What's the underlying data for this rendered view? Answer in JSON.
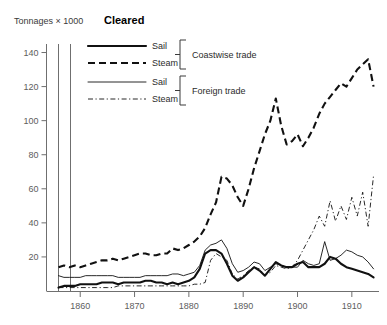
{
  "chart_data": {
    "type": "line",
    "title": "Cleared",
    "ylabel": "Tonnages × 1000",
    "xlabel": "",
    "xlim": [
      1856,
      1915
    ],
    "ylim": [
      0,
      145
    ],
    "grid": false,
    "legend_position": "top-center",
    "y_ticks": [
      20,
      40,
      60,
      80,
      100,
      120,
      140
    ],
    "x_ticks": [
      1860,
      1870,
      1880,
      1890,
      1900,
      1910
    ],
    "legend_groups": [
      {
        "group_label": "Coastwise trade",
        "entries": [
          {
            "name": "Sail",
            "style": "thick-solid"
          },
          {
            "name": "Steam",
            "style": "thick-dashed"
          }
        ]
      },
      {
        "group_label": "Foreign trade",
        "entries": [
          {
            "name": "Sail",
            "style": "thin-solid"
          },
          {
            "name": "Steam",
            "style": "thin-dash-dot"
          }
        ]
      }
    ],
    "series": [
      {
        "name": "Coastwise Sail",
        "style": "thick-solid",
        "x": [
          1856,
          1857,
          1858,
          1859,
          1860,
          1861,
          1862,
          1863,
          1864,
          1865,
          1866,
          1867,
          1868,
          1869,
          1870,
          1871,
          1872,
          1873,
          1874,
          1875,
          1876,
          1877,
          1878,
          1879,
          1880,
          1881,
          1882,
          1883,
          1884,
          1885,
          1886,
          1887,
          1888,
          1889,
          1890,
          1891,
          1892,
          1893,
          1894,
          1895,
          1896,
          1897,
          1898,
          1899,
          1900,
          1901,
          1902,
          1903,
          1904,
          1905,
          1906,
          1907,
          1908,
          1909,
          1910,
          1911,
          1912,
          1913,
          1914
        ],
        "values": [
          2,
          3,
          3,
          3,
          4,
          4,
          4,
          4,
          5,
          5,
          5,
          4,
          5,
          5,
          5,
          5,
          6,
          6,
          5,
          5,
          4,
          5,
          4,
          5,
          6,
          8,
          13,
          22,
          24,
          24,
          22,
          16,
          9,
          6,
          8,
          11,
          14,
          12,
          9,
          13,
          17,
          15,
          14,
          14,
          16,
          17,
          14,
          14,
          14,
          16,
          20,
          19,
          16,
          14,
          13,
          12,
          11,
          10,
          8
        ]
      },
      {
        "name": "Coastwise Steam",
        "style": "thick-dashed",
        "x": [
          1856,
          1857,
          1858,
          1859,
          1860,
          1861,
          1862,
          1863,
          1864,
          1865,
          1866,
          1867,
          1868,
          1869,
          1870,
          1871,
          1872,
          1873,
          1874,
          1875,
          1876,
          1877,
          1878,
          1879,
          1880,
          1881,
          1882,
          1883,
          1884,
          1885,
          1886,
          1887,
          1888,
          1889,
          1890,
          1891,
          1892,
          1893,
          1894,
          1895,
          1896,
          1897,
          1898,
          1899,
          1900,
          1901,
          1902,
          1903,
          1904,
          1905,
          1906,
          1907,
          1908,
          1909,
          1910,
          1911,
          1912,
          1913,
          1914
        ],
        "values": [
          14,
          15,
          14,
          15,
          14,
          15,
          16,
          17,
          18,
          18,
          19,
          18,
          19,
          20,
          21,
          22,
          22,
          21,
          21,
          22,
          22,
          25,
          24,
          25,
          27,
          29,
          32,
          37,
          45,
          52,
          67,
          66,
          62,
          55,
          50,
          60,
          72,
          82,
          92,
          100,
          113,
          97,
          86,
          88,
          92,
          85,
          90,
          96,
          104,
          110,
          114,
          118,
          122,
          120,
          125,
          130,
          133,
          136,
          120
        ]
      },
      {
        "name": "Foreign Sail",
        "style": "thin-solid",
        "x": [
          1856,
          1857,
          1858,
          1859,
          1860,
          1861,
          1862,
          1863,
          1864,
          1865,
          1866,
          1867,
          1868,
          1869,
          1870,
          1871,
          1872,
          1873,
          1874,
          1875,
          1876,
          1877,
          1878,
          1879,
          1880,
          1881,
          1882,
          1883,
          1884,
          1885,
          1886,
          1887,
          1888,
          1889,
          1890,
          1891,
          1892,
          1893,
          1894,
          1895,
          1896,
          1897,
          1898,
          1899,
          1900,
          1901,
          1902,
          1903,
          1904,
          1905,
          1906,
          1907,
          1908,
          1909,
          1910,
          1911,
          1912,
          1913,
          1914
        ],
        "values": [
          9,
          8,
          8,
          8,
          8,
          9,
          9,
          9,
          9,
          9,
          9,
          8,
          8,
          8,
          8,
          8,
          9,
          9,
          9,
          9,
          9,
          10,
          10,
          9,
          10,
          11,
          15,
          24,
          27,
          28,
          30,
          25,
          16,
          11,
          12,
          14,
          17,
          16,
          12,
          14,
          16,
          15,
          14,
          14,
          14,
          18,
          16,
          15,
          16,
          29,
          18,
          19,
          21,
          24,
          23,
          21,
          20,
          17,
          13
        ]
      },
      {
        "name": "Foreign Steam",
        "style": "thin-dash-dot",
        "x": [
          1856,
          1857,
          1858,
          1859,
          1860,
          1861,
          1862,
          1863,
          1864,
          1865,
          1866,
          1867,
          1868,
          1869,
          1870,
          1871,
          1872,
          1873,
          1874,
          1875,
          1876,
          1877,
          1878,
          1879,
          1880,
          1881,
          1882,
          1883,
          1884,
          1885,
          1886,
          1887,
          1888,
          1889,
          1890,
          1891,
          1892,
          1893,
          1894,
          1895,
          1896,
          1897,
          1898,
          1899,
          1900,
          1901,
          1902,
          1903,
          1904,
          1905,
          1906,
          1907,
          1908,
          1909,
          1910,
          1911,
          1912,
          1913,
          1914
        ],
        "values": [
          2,
          2,
          2,
          2,
          2,
          2,
          2,
          2,
          2,
          2,
          2,
          3,
          3,
          3,
          3,
          3,
          3,
          3,
          3,
          3,
          3,
          3,
          3,
          3,
          3,
          4,
          4,
          5,
          18,
          22,
          20,
          18,
          10,
          7,
          9,
          12,
          14,
          13,
          9,
          11,
          15,
          14,
          13,
          14,
          18,
          24,
          30,
          36,
          44,
          38,
          53,
          41,
          50,
          42,
          55,
          44,
          58,
          38,
          68
        ]
      }
    ]
  }
}
